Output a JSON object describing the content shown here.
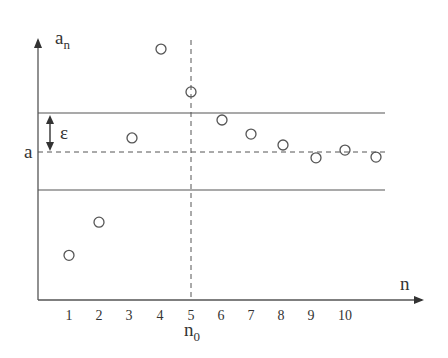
{
  "figure": {
    "y_axis_label": "a",
    "y_axis_label_sub": "n",
    "x_axis_label": "n",
    "limit_label": "a",
    "epsilon_label": "ε",
    "n0_label": "n",
    "n0_label_sub": "0",
    "x_ticks": [
      "1",
      "2",
      "3",
      "4",
      "5",
      "6",
      "7",
      "8",
      "9",
      "10"
    ]
  },
  "chart_data": {
    "type": "scatter",
    "title": "",
    "xlabel": "n",
    "ylabel": "a_n",
    "x": [
      1,
      2,
      3,
      4,
      5,
      6,
      7,
      8,
      9,
      10,
      11
    ],
    "values": [
      -2.65,
      -1.8,
      0.36,
      2.64,
      1.54,
      0.82,
      0.46,
      0.18,
      -0.15,
      0.05,
      -0.13
    ],
    "value_units": "relative to limit a, in units of epsilon",
    "x_tick_labels": [
      "1",
      "2",
      "3",
      "4",
      "5",
      "6",
      "7",
      "8",
      "9",
      "10"
    ],
    "reference_lines": [
      {
        "name": "a",
        "type": "horizontal",
        "style": "dashed",
        "value": 0
      },
      {
        "name": "a + ε",
        "type": "horizontal",
        "style": "solid",
        "value": 1
      },
      {
        "name": "a - ε",
        "type": "horizontal",
        "style": "solid",
        "value": -1
      },
      {
        "name": "n0",
        "type": "vertical",
        "style": "dashed",
        "value": 5
      }
    ],
    "annotations": [
      "ε (double arrow between a and a+ε)",
      "n0 below tick 5"
    ],
    "grid": false,
    "legend": null
  }
}
